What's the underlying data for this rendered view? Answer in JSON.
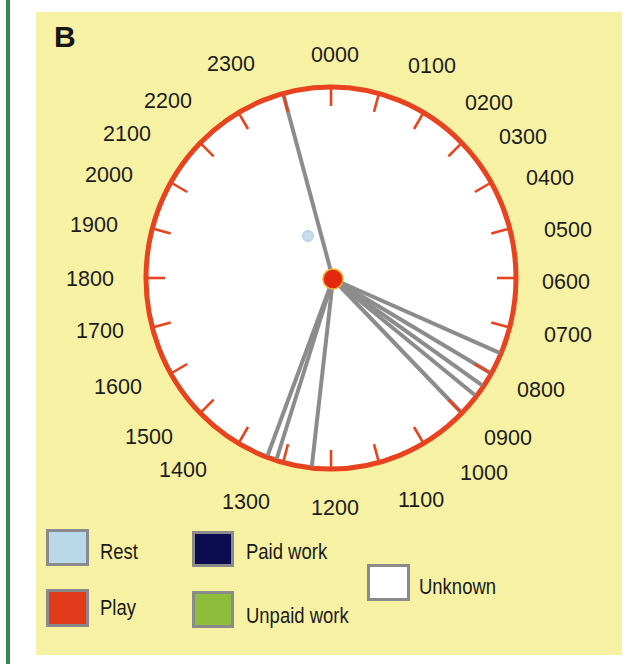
{
  "panel": {
    "label": "B"
  },
  "chart_data": {
    "type": "scatter",
    "coordinate_system": "polar 24-hour clock, 0000 at top, clockwise",
    "title": "",
    "xlabel": "",
    "ylabel": "",
    "grid": false,
    "ticks": 24,
    "tick_labels": [
      "0000",
      "0100",
      "0200",
      "0300",
      "0400",
      "0500",
      "0600",
      "0700",
      "0800",
      "0900",
      "1000",
      "1100",
      "1200",
      "1300",
      "1400",
      "1500",
      "1600",
      "1700",
      "1800",
      "1900",
      "2000",
      "2100",
      "2200",
      "2300"
    ],
    "center_marker": {
      "category": "Play",
      "color": "#e2280f"
    },
    "faint_marker": {
      "category": "Rest",
      "color": "#c9dcee"
    },
    "series": [
      {
        "name": "Observed activity bouts",
        "category": "Unknown",
        "line_color": "#8c8c8c",
        "times_hours": [
          23.0,
          7.55,
          8.0,
          8.3,
          8.55,
          9.0,
          12.4,
          13.15,
          13.35
        ],
        "times_hhmm": [
          "2300",
          "0733",
          "0800",
          "0818",
          "0833",
          "0900",
          "1224",
          "1309",
          "1321"
        ]
      }
    ],
    "ring_color": "#e8431e",
    "legend_position": "bottom",
    "legend": [
      {
        "label": "Rest",
        "color": "#b9d9ea"
      },
      {
        "label": "Play",
        "color": "#e23b1c"
      },
      {
        "label": "Paid work",
        "color": "#0b0b4f"
      },
      {
        "label": "Unpaid work",
        "color": "#8ebd3c"
      },
      {
        "label": "Unknown",
        "color": "#ffffff"
      }
    ]
  }
}
